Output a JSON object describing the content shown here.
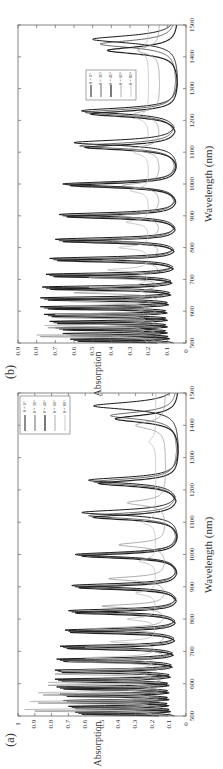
{
  "figure": {
    "orientation": "rotated-90-ccw",
    "panels": [
      "b",
      "a"
    ]
  },
  "chart_data": [
    {
      "panel_label": "(a)",
      "type": "line",
      "title": "",
      "xlabel": "Wavelength (nm)",
      "ylabel": "Absorption",
      "xlim": [
        500,
        1500
      ],
      "ylim": [
        0,
        1
      ],
      "xticks": [
        500,
        600,
        700,
        800,
        900,
        1000,
        1100,
        1200,
        1300,
        1400,
        1500
      ],
      "yticks": [
        "0",
        "0.1",
        "0.2",
        "0.3",
        "0.4",
        "0.5",
        "0.6",
        "0.7",
        "0.8",
        "0.9",
        "1"
      ],
      "grid": false,
      "legend_position": "upper right",
      "legend": [
        "θ = 0°",
        "θ = 30°",
        "θ = 40°",
        "θ = 60°",
        "θ = 80°"
      ],
      "series": [
        {
          "name": "θ = 0°",
          "color": "#1a1a1a",
          "width": 1.0,
          "floor": 0.04,
          "peaks": [
            [
              512,
              0.66
            ],
            [
              530,
              0.7
            ],
            [
              548,
              0.73
            ],
            [
              568,
              0.75
            ],
            [
              590,
              0.77
            ],
            [
              614,
              0.78
            ],
            [
              642,
              0.78
            ],
            [
              676,
              0.77
            ],
            [
              716,
              0.75
            ],
            [
              766,
              0.72
            ],
            [
              826,
              0.7
            ],
            [
              904,
              0.68
            ],
            [
              1000,
              0.66
            ],
            [
              1130,
              0.62
            ],
            [
              1230,
              0.58
            ],
            [
              1460,
              0.55
            ]
          ]
        },
        {
          "name": "θ = 30°",
          "color": "#444444",
          "width": 0.8,
          "floor": 0.05,
          "peaks": [
            [
              508,
              0.64
            ],
            [
              526,
              0.68
            ],
            [
              544,
              0.71
            ],
            [
              564,
              0.73
            ],
            [
              586,
              0.75
            ],
            [
              610,
              0.76
            ],
            [
              638,
              0.76
            ],
            [
              672,
              0.75
            ],
            [
              712,
              0.73
            ],
            [
              762,
              0.7
            ],
            [
              822,
              0.68
            ],
            [
              900,
              0.66
            ],
            [
              998,
              0.64
            ],
            [
              1120,
              0.58
            ],
            [
              1225,
              0.55
            ],
            [
              1430,
              0.45
            ]
          ]
        },
        {
          "name": "θ = 40°",
          "color": "#222222",
          "width": 1.2,
          "floor": 0.04,
          "peaks": [
            [
              505,
              0.62
            ],
            [
              523,
              0.66
            ],
            [
              541,
              0.69
            ],
            [
              561,
              0.71
            ],
            [
              583,
              0.73
            ],
            [
              607,
              0.74
            ],
            [
              635,
              0.74
            ],
            [
              669,
              0.73
            ],
            [
              709,
              0.71
            ],
            [
              759,
              0.69
            ],
            [
              819,
              0.66
            ],
            [
              897,
              0.64
            ],
            [
              995,
              0.62
            ],
            [
              1115,
              0.55
            ],
            [
              1220,
              0.52
            ],
            [
              1420,
              0.42
            ]
          ]
        },
        {
          "name": "θ = 60°",
          "color": "#999999",
          "width": 0.8,
          "floor": 0.12,
          "peaks": [
            [
              515,
              0.9
            ],
            [
              540,
              0.88
            ],
            [
              565,
              0.85
            ],
            [
              595,
              0.82
            ],
            [
              630,
              0.78
            ],
            [
              668,
              0.7
            ],
            [
              712,
              0.6
            ],
            [
              770,
              0.55
            ],
            [
              840,
              0.5
            ],
            [
              925,
              0.46
            ],
            [
              1030,
              0.4
            ],
            [
              1160,
              0.35
            ],
            [
              1400,
              0.3
            ]
          ]
        },
        {
          "name": "θ = 80°",
          "color": "#bbbbbb",
          "width": 0.8,
          "floor": 0.18,
          "peaks": [
            [
              520,
              0.96
            ],
            [
              545,
              0.93
            ],
            [
              572,
              0.88
            ],
            [
              604,
              0.82
            ],
            [
              640,
              0.74
            ],
            [
              680,
              0.6
            ],
            [
              730,
              0.45
            ],
            [
              800,
              0.35
            ],
            [
              880,
              0.3
            ],
            [
              980,
              0.28
            ],
            [
              1100,
              0.26
            ],
            [
              1350,
              0.22
            ]
          ]
        }
      ]
    },
    {
      "panel_label": "(b)",
      "type": "line",
      "title": "",
      "xlabel": "Wavelength (nm)",
      "ylabel": "Absorption",
      "xlim": [
        500,
        1500
      ],
      "ylim": [
        0,
        0.9
      ],
      "xticks": [
        500,
        600,
        700,
        800,
        900,
        1000,
        1100,
        1200,
        1300,
        1400,
        1500
      ],
      "yticks": [
        "0",
        "0.1",
        "0.2",
        "0.3",
        "0.4",
        "0.5",
        "0.6",
        "0.7",
        "0.8",
        "0.9"
      ],
      "grid": false,
      "legend_position": "center right",
      "legend": [
        "θ = 0°",
        "θ = 30°",
        "θ = 40°",
        "θ = 60°",
        "θ = 80°"
      ],
      "series": [
        {
          "name": "θ = 0°",
          "color": "#1a1a1a",
          "width": 1.0,
          "floor": 0.04,
          "peaks": [
            [
              512,
              0.62
            ],
            [
              530,
              0.66
            ],
            [
              548,
              0.7
            ],
            [
              568,
              0.73
            ],
            [
              590,
              0.76
            ],
            [
              614,
              0.78
            ],
            [
              642,
              0.78
            ],
            [
              676,
              0.77
            ],
            [
              716,
              0.75
            ],
            [
              766,
              0.73
            ],
            [
              826,
              0.7
            ],
            [
              904,
              0.68
            ],
            [
              1000,
              0.66
            ],
            [
              1130,
              0.6
            ],
            [
              1230,
              0.56
            ],
            [
              1455,
              0.5
            ]
          ]
        },
        {
          "name": "θ = 30°",
          "color": "#444444",
          "width": 0.8,
          "floor": 0.05,
          "peaks": [
            [
              508,
              0.6
            ],
            [
              526,
              0.64
            ],
            [
              544,
              0.68
            ],
            [
              564,
              0.71
            ],
            [
              586,
              0.74
            ],
            [
              610,
              0.76
            ],
            [
              638,
              0.76
            ],
            [
              672,
              0.75
            ],
            [
              712,
              0.73
            ],
            [
              762,
              0.71
            ],
            [
              822,
              0.68
            ],
            [
              900,
              0.66
            ],
            [
              998,
              0.64
            ],
            [
              1120,
              0.57
            ],
            [
              1225,
              0.54
            ],
            [
              1440,
              0.46
            ]
          ]
        },
        {
          "name": "θ = 40°",
          "color": "#222222",
          "width": 1.2,
          "floor": 0.04,
          "peaks": [
            [
              505,
              0.58
            ],
            [
              523,
              0.62
            ],
            [
              541,
              0.66
            ],
            [
              561,
              0.69
            ],
            [
              583,
              0.72
            ],
            [
              607,
              0.74
            ],
            [
              635,
              0.74
            ],
            [
              669,
              0.73
            ],
            [
              709,
              0.71
            ],
            [
              759,
              0.69
            ],
            [
              819,
              0.66
            ],
            [
              897,
              0.64
            ],
            [
              995,
              0.62
            ],
            [
              1115,
              0.54
            ],
            [
              1220,
              0.51
            ],
            [
              1420,
              0.42
            ]
          ]
        },
        {
          "name": "θ = 60°",
          "color": "#999999",
          "width": 0.8,
          "floor": 0.14,
          "peaks": [
            [
              520,
              0.78
            ],
            [
              548,
              0.74
            ],
            [
              580,
              0.7
            ],
            [
              616,
              0.66
            ],
            [
              658,
              0.6
            ],
            [
              706,
              0.52
            ],
            [
              760,
              0.45
            ],
            [
              822,
              0.4
            ],
            [
              900,
              0.36
            ],
            [
              995,
              0.34
            ],
            [
              1110,
              0.3
            ],
            [
              1220,
              0.28
            ],
            [
              1420,
              0.26
            ]
          ]
        },
        {
          "name": "θ = 80°",
          "color": "#bbbbbb",
          "width": 0.8,
          "floor": 0.2,
          "peaks": [
            [
              525,
              0.8
            ],
            [
              555,
              0.76
            ],
            [
              590,
              0.7
            ],
            [
              630,
              0.62
            ],
            [
              675,
              0.52
            ],
            [
              730,
              0.42
            ],
            [
              800,
              0.36
            ],
            [
              880,
              0.32
            ],
            [
              980,
              0.3
            ],
            [
              1100,
              0.28
            ],
            [
              1210,
              0.27
            ],
            [
              1420,
              0.25
            ]
          ]
        }
      ]
    }
  ]
}
